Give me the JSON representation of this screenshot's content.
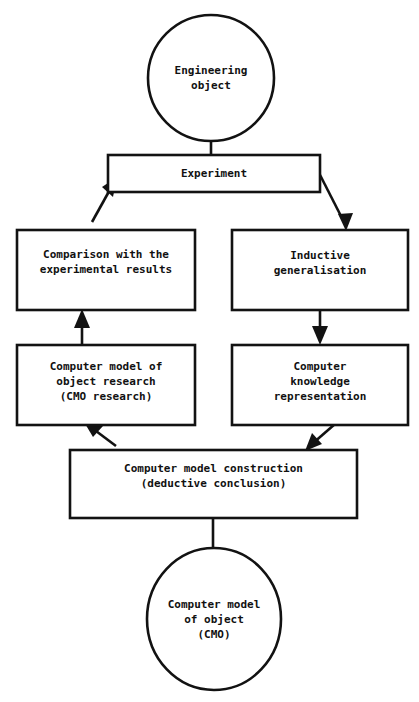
{
  "diagram": {
    "style": {
      "stroke_color": "#121212",
      "fill_color": "#ffffff",
      "text_color": "#111111",
      "stroke_width": 2.4
    },
    "nodes": [
      {
        "id": "engineering-object",
        "shape": "ellipse",
        "label": "Engineering\nobject",
        "x": 148,
        "y": 15,
        "width": 126,
        "height": 126
      },
      {
        "id": "experiment",
        "shape": "rect",
        "label": "Experiment",
        "x": 108,
        "y": 155,
        "width": 212,
        "height": 37
      },
      {
        "id": "comparison",
        "shape": "rect",
        "label": "Comparison with the\nexperimental results",
        "x": 17,
        "y": 230,
        "width": 178,
        "height": 80
      },
      {
        "id": "inductive-generalisation",
        "shape": "rect",
        "label": "Inductive\ngeneralisation",
        "x": 232,
        "y": 230,
        "width": 176,
        "height": 80
      },
      {
        "id": "cmo-research",
        "shape": "rect",
        "label": "Computer model of\nobject research\n(CMO research)",
        "x": 17,
        "y": 345,
        "width": 178,
        "height": 80
      },
      {
        "id": "knowledge-representation",
        "shape": "rect",
        "label": "Computer\nknowledge\nrepresentation",
        "x": 232,
        "y": 345,
        "width": 176,
        "height": 80
      },
      {
        "id": "model-construction",
        "shape": "rect",
        "label": "Computer model construction\n(deductive conclusion)",
        "x": 70,
        "y": 450,
        "width": 287,
        "height": 68
      },
      {
        "id": "computer-model-of-object",
        "shape": "ellipse",
        "label": "Computer model\nof object\n(CMO)",
        "x": 147,
        "y": 548,
        "width": 134,
        "height": 142
      }
    ],
    "edges": [
      {
        "id": "engineering-object-to-experiment",
        "from": "engineering-object",
        "to": "experiment",
        "arrowhead": false,
        "kind": "vertical-connector"
      },
      {
        "id": "experiment-to-inductive-generalisation",
        "from": "experiment",
        "to": "inductive-generalisation",
        "arrowhead": true,
        "kind": "diagonal-down-right"
      },
      {
        "id": "inductive-generalisation-to-knowledge-representation",
        "from": "inductive-generalisation",
        "to": "knowledge-representation",
        "arrowhead": true,
        "kind": "vertical-down"
      },
      {
        "id": "knowledge-representation-to-model-construction",
        "from": "knowledge-representation",
        "to": "model-construction",
        "arrowhead": true,
        "kind": "diagonal-down-left"
      },
      {
        "id": "model-construction-to-computer-model-of-object",
        "from": "model-construction",
        "to": "computer-model-of-object",
        "arrowhead": false,
        "kind": "vertical-connector"
      },
      {
        "id": "model-construction-to-cmo-research",
        "from": "model-construction",
        "to": "cmo-research",
        "arrowhead": true,
        "kind": "diagonal-up-left"
      },
      {
        "id": "cmo-research-to-comparison",
        "from": "cmo-research",
        "to": "comparison",
        "arrowhead": true,
        "kind": "vertical-up"
      },
      {
        "id": "comparison-to-experiment",
        "from": "comparison",
        "to": "experiment",
        "arrowhead": true,
        "kind": "diagonal-up-right"
      }
    ]
  }
}
